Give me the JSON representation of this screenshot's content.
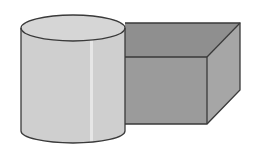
{
  "diagram": {
    "shapes": [
      {
        "kind": "cylinder",
        "label": "cylinder"
      },
      {
        "kind": "box",
        "label": "rectangular prism"
      }
    ],
    "colors": {
      "background": "#ffffff",
      "cylinder_side": "#cfcfcf",
      "cylinder_top": "#d6d6d6",
      "cylinder_highlight": "#e6e6e6",
      "box_front": "#9b9b9b",
      "box_top": "#8f8f8f",
      "box_side": "#a6a6a6",
      "outline": "#3a3a3a"
    }
  }
}
